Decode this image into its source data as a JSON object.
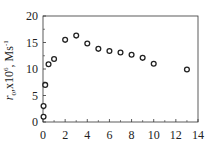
{
  "chart_data": {
    "type": "scatter",
    "title": "",
    "xlabel": "",
    "ylabel": "r0,x10^6, Ms^-1",
    "ylabel_parts": {
      "var": "r",
      "sub": "0",
      "mid": ",x10",
      "sup1": "6",
      "unit": ", Ms",
      "sup2": "-1"
    },
    "xlim": [
      0,
      14
    ],
    "ylim": [
      0,
      20
    ],
    "xticks": [
      0,
      2,
      4,
      6,
      8,
      10,
      12,
      14
    ],
    "yticks": [
      0,
      5,
      10,
      15,
      20
    ],
    "grid": false,
    "legend": null,
    "marker": "open-circle",
    "series": [
      {
        "name": "r0",
        "x": [
          0.05,
          0.05,
          0.2,
          0.5,
          1.0,
          2,
          3,
          4,
          5,
          6,
          7,
          8,
          9,
          10,
          13
        ],
        "y": [
          1.0,
          3.0,
          7.0,
          10.9,
          11.9,
          15.5,
          16.3,
          14.8,
          13.8,
          13.4,
          13.1,
          12.7,
          12.1,
          11.0,
          9.9
        ]
      }
    ]
  },
  "colors": {
    "axis": "#333333",
    "marker": "#222222",
    "background": "#ffffff"
  }
}
